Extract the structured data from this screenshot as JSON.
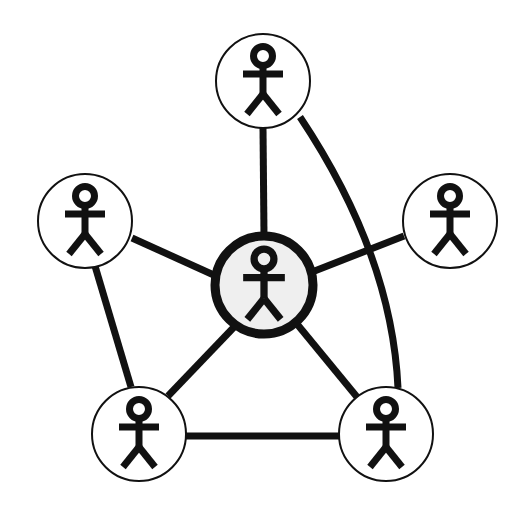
{
  "figure": {
    "width": 519,
    "height": 511,
    "background_color": "#ffffff"
  },
  "style": {
    "stroke_color": "#111111",
    "peripheral_fill": "#ffffff",
    "peripheral_stroke_width": 2,
    "center_fill": "#efefef",
    "center_stroke_width": 9,
    "edge_width": 7,
    "figure_color": "#111111",
    "figure_stroke_width": 7
  },
  "nodes": [
    {
      "id": "center",
      "label": "center-person",
      "role": "hub",
      "cx": 264,
      "cy": 285,
      "r": 49,
      "emphasis": "highlighted",
      "fill": "#efefef",
      "stroke_width": 9,
      "figure_scale": 1.0
    },
    {
      "id": "top",
      "label": "top-person",
      "role": "peer",
      "cx": 263,
      "cy": 81,
      "r": 47,
      "emphasis": "normal",
      "fill": "#ffffff",
      "stroke_width": 2,
      "figure_scale": 1.0
    },
    {
      "id": "left",
      "label": "left-person",
      "role": "peer",
      "cx": 85,
      "cy": 221,
      "r": 47,
      "emphasis": "normal",
      "fill": "#ffffff",
      "stroke_width": 2,
      "figure_scale": 1.0
    },
    {
      "id": "right",
      "label": "right-person",
      "role": "peer",
      "cx": 450,
      "cy": 221,
      "r": 47,
      "emphasis": "normal",
      "fill": "#ffffff",
      "stroke_width": 2,
      "figure_scale": 1.0
    },
    {
      "id": "bottom-left",
      "label": "bottom-left-person",
      "role": "peer",
      "cx": 139,
      "cy": 434,
      "r": 47,
      "emphasis": "normal",
      "fill": "#ffffff",
      "stroke_width": 2,
      "figure_scale": 1.0
    },
    {
      "id": "bottom-right",
      "label": "bottom-right-person",
      "role": "peer",
      "cx": 386,
      "cy": 434,
      "r": 47,
      "emphasis": "normal",
      "fill": "#ffffff",
      "stroke_width": 2,
      "figure_scale": 1.0
    }
  ],
  "edges": [
    {
      "id": "center-top",
      "from": "center",
      "to": "top",
      "shape": "straight",
      "path": "M 264 236 L 263 128"
    },
    {
      "id": "center-left",
      "from": "center",
      "to": "left",
      "shape": "straight",
      "path": "M 216 276 L 132 238"
    },
    {
      "id": "center-right",
      "from": "center",
      "to": "right",
      "shape": "straight",
      "path": "M 312 272 L 404 236"
    },
    {
      "id": "center-bottom-left",
      "from": "center",
      "to": "bottom-left",
      "shape": "straight",
      "path": "M 236 325 L 168 396"
    },
    {
      "id": "center-bottom-right",
      "from": "center",
      "to": "bottom-right",
      "shape": "straight",
      "path": "M 297 324 L 357 397"
    },
    {
      "id": "left-bottom-left",
      "from": "left",
      "to": "bottom-left",
      "shape": "straight",
      "path": "M 95 266 L 131 387"
    },
    {
      "id": "bottom-left-bottom-right",
      "from": "bottom-left",
      "to": "bottom-right",
      "shape": "straight",
      "path": "M 186 436 L 339 436"
    },
    {
      "id": "top-bottom-right",
      "from": "top",
      "to": "bottom-right",
      "shape": "curved",
      "path": "M 300 117 Q 392 255 398 388"
    }
  ],
  "stick_figure": {
    "parts": [
      "head-ring",
      "arms-bar",
      "torso-line",
      "left-leg",
      "right-leg"
    ],
    "head_radius_ratio": 0.165,
    "description": "Simple stick person with ring head, straight horizontal arms, vertical torso and two splayed legs"
  }
}
